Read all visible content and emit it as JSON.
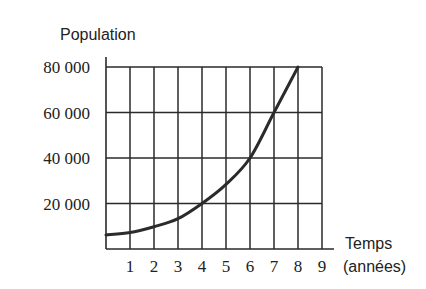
{
  "chart_data": {
    "type": "line",
    "title": "",
    "ylabel": "Population",
    "xlabel": "Temps (années)",
    "xlabel_lines": [
      "Temps",
      "(années)"
    ],
    "x_ticks": [
      1,
      2,
      3,
      4,
      5,
      6,
      7,
      8,
      9
    ],
    "x_tick_labels": [
      "1",
      "2",
      "3",
      "4",
      "5",
      "6",
      "7",
      "8",
      "9"
    ],
    "y_ticks": [
      20000,
      40000,
      60000,
      80000
    ],
    "y_tick_labels": [
      "20 000",
      "40 000",
      "60 000",
      "80 000"
    ],
    "xlim": [
      0,
      9
    ],
    "ylim": [
      0,
      80000
    ],
    "grid": true,
    "legend": null,
    "series": [
      {
        "name": "Population",
        "x": [
          0,
          1,
          2,
          3,
          4,
          5,
          6,
          7,
          8
        ],
        "values": [
          6200,
          7200,
          9800,
          13300,
          20000,
          28400,
          40000,
          60000,
          80000
        ]
      }
    ]
  }
}
